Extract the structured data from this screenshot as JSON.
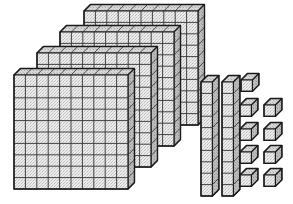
{
  "image": {
    "title": "Base Ten Blocks Place Value Model",
    "description": "Base-ten manipulative blocks: four hundred-flats, two ten-rods, and nine unit cubes.",
    "width": 293,
    "height": 204,
    "background_color": "#ffffff"
  },
  "style": {
    "front_face_color": "#ebebeb",
    "top_face_color": "#d4d4d4",
    "side_face_color": "#b4b4b4",
    "outline_color": "#1a1a1a",
    "grid_line_color": "#3a3a3a",
    "texture_speckle_color": "#9a9a9a"
  },
  "model": {
    "total_value": 429,
    "flat_value": 100,
    "rod_value": 10,
    "cube_value": 1,
    "flat_count": 4,
    "rod_count": 2,
    "cube_count": 9,
    "flat_grid_columns": 10,
    "flat_grid_rows": 10,
    "rod_segments": 10
  },
  "groups": [
    {
      "name": "hundreds",
      "label": "Hundreds flats",
      "count": 4,
      "unit_value": 100,
      "subtotal": 400
    },
    {
      "name": "tens",
      "label": "Tens rods",
      "count": 2,
      "unit_value": 10,
      "subtotal": 20
    },
    {
      "name": "ones",
      "label": "Unit cubes",
      "count": 9,
      "unit_value": 1,
      "subtotal": 9
    }
  ],
  "chart_data": {
    "type": "bar",
    "categories": [
      "Hundreds",
      "Tens",
      "Ones"
    ],
    "values": [
      4,
      2,
      9
    ],
    "xlabel": "Place value",
    "ylabel": "Block count",
    "ylim": [
      0,
      10
    ],
    "annotations": [
      "400",
      "20",
      "9",
      "429"
    ]
  },
  "geometry": {
    "cell": 11.4,
    "depth_x": 6.5,
    "depth_y": -6.5,
    "flats": [
      {
        "id": "flat-4-back",
        "x": 84.0,
        "y": 11.0
      },
      {
        "id": "flat-3",
        "x": 60.0,
        "y": 32.0
      },
      {
        "id": "flat-2",
        "x": 37.0,
        "y": 53.0
      },
      {
        "id": "flat-1-front",
        "x": 14.0,
        "y": 75.0
      }
    ],
    "rods": [
      {
        "id": "rod-1",
        "x": 201.0,
        "y": 82.0
      },
      {
        "id": "rod-2",
        "x": 222.0,
        "y": 82.0
      }
    ],
    "cubes": [
      {
        "id": "cube-1",
        "x": 241.0,
        "y": 80.0
      },
      {
        "id": "cube-2",
        "x": 240.0,
        "y": 105.0
      },
      {
        "id": "cube-3",
        "x": 264.0,
        "y": 105.0
      },
      {
        "id": "cube-4",
        "x": 240.0,
        "y": 129.0
      },
      {
        "id": "cube-5",
        "x": 264.0,
        "y": 129.0
      },
      {
        "id": "cube-6",
        "x": 240.0,
        "y": 152.0
      },
      {
        "id": "cube-7",
        "x": 264.0,
        "y": 152.0
      },
      {
        "id": "cube-8",
        "x": 240.0,
        "y": 175.0
      },
      {
        "id": "cube-9",
        "x": 264.0,
        "y": 175.0
      }
    ]
  }
}
